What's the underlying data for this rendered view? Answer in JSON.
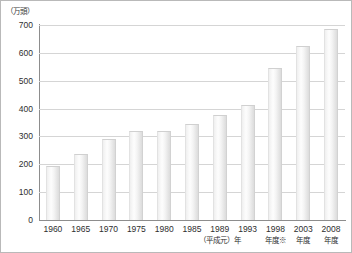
{
  "figure": {
    "unit_label": "（万頭）",
    "background": "#ffffff",
    "border_color": "#b9b9b9",
    "bar_color": "#f2f2f2",
    "grid_color": "#d5d5d5",
    "axis_color": "#8d8d8d"
  },
  "chart_data": {
    "type": "bar",
    "title": "",
    "subtitle": "",
    "xlabel": "",
    "ylabel": "（万頭）",
    "ylim": [
      0,
      700
    ],
    "yticks": [
      0,
      100,
      200,
      300,
      400,
      500,
      600,
      700
    ],
    "ytick_labels": [
      "0",
      "100",
      "200",
      "300",
      "400",
      "500",
      "600",
      "700"
    ],
    "grid": true,
    "legend": false,
    "categories": [
      "1960",
      "1965",
      "1970",
      "1975",
      "1980",
      "1985",
      "1989",
      "1993",
      "1998",
      "2003",
      "2008"
    ],
    "category_sublabels": [
      "",
      "",
      "",
      "",
      "",
      "",
      "（平成元）年",
      "",
      "年度※",
      "年度",
      "年度"
    ],
    "values": [
      193,
      237,
      292,
      320,
      320,
      346,
      376,
      413,
      546,
      626,
      686
    ],
    "annotations": [
      "（平成元）年",
      "年度※"
    ]
  }
}
